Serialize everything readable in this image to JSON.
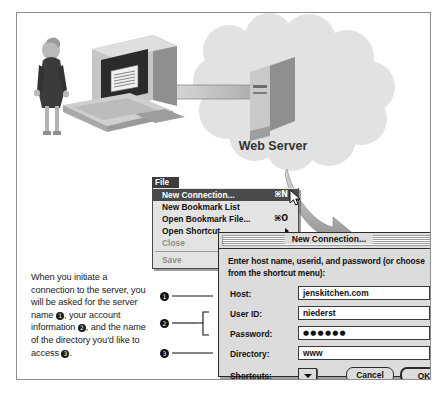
{
  "figure": {
    "caption": {
      "segments": [
        "When you initiate a connection to the server, you will be asked for the server name ",
        "❶",
        ", your account information ",
        "❷",
        ", and the name of the directory you'd like to access ",
        "❸",
        "."
      ],
      "text": "When you initiate a connection to the server, you will be asked for the server name ❶, your account information ❷, and the name of the directory you'd like to access ❸."
    }
  },
  "illustration": {
    "server_label": "Web Server",
    "person_alt": "person-standing",
    "computer_alt": "desktop-computer",
    "cloud_alt": "network-cloud",
    "arrow_alt": "connection-arrow",
    "cloud_color": "#e0e0e0",
    "person_color": "#3d3d3d",
    "computer_color": "#b5b5b5"
  },
  "menu": {
    "title": "File",
    "items": [
      {
        "label": "New Connection...",
        "shortcut": "⌘N",
        "selected": true,
        "disabled": false,
        "submenu": false
      },
      {
        "label": "New Bookmark List",
        "shortcut": "",
        "selected": false,
        "disabled": false,
        "submenu": false
      },
      {
        "label": "Open Bookmark File...",
        "shortcut": "⌘O",
        "selected": false,
        "disabled": false,
        "submenu": false
      },
      {
        "label": "Open Shortcut",
        "shortcut": "",
        "selected": false,
        "disabled": false,
        "submenu": true
      },
      {
        "label": "Close",
        "shortcut": "⌘W",
        "selected": false,
        "disabled": true,
        "submenu": false
      },
      {
        "label": "Save",
        "shortcut": "",
        "selected": false,
        "disabled": true,
        "submenu": false
      }
    ]
  },
  "dialog": {
    "title": "New Connection...",
    "prompt": "Enter host name, userid, and password (or choose from the shortcut menu):",
    "fields": [
      {
        "label": "Host:",
        "value": "jenskitchen.com",
        "type": "text"
      },
      {
        "label": "User ID:",
        "value": "niederst",
        "type": "text"
      },
      {
        "label": "Password:",
        "value": "●●●●●●",
        "type": "password"
      },
      {
        "label": "Directory:",
        "value": "www",
        "type": "text"
      }
    ],
    "shortcuts_label": "Shortcuts:",
    "shortcuts_selected": "",
    "cancel_label": "Cancel",
    "ok_label": "OK"
  },
  "callouts": [
    {
      "number": "❶",
      "target": "Host"
    },
    {
      "number": "❷",
      "target": "User ID / Password"
    },
    {
      "number": "❸",
      "target": "Directory"
    }
  ]
}
